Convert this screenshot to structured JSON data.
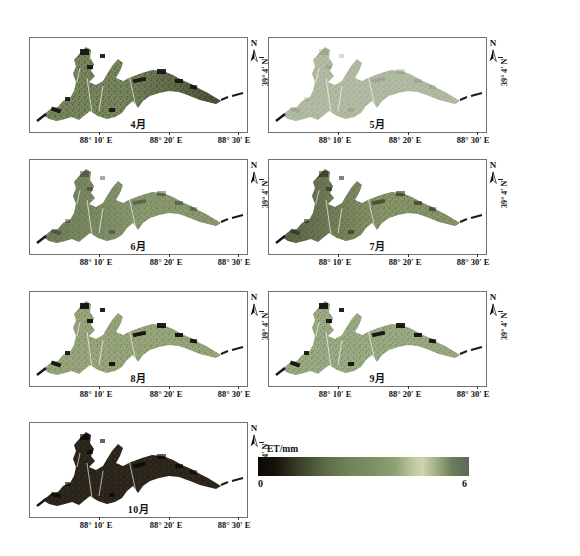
{
  "figure": {
    "north_label": "N",
    "lat_label": "39° 4′ N",
    "x_ticks": [
      "88° 10′ E",
      "88° 20′ E",
      "88° 30′ E"
    ],
    "colorbar": {
      "label": "ET/mm",
      "min": "0",
      "max": "6",
      "gradient": [
        {
          "color": "#0c0a07",
          "pos": 0
        },
        {
          "color": "#181209",
          "pos": 8
        },
        {
          "color": "#3a4229",
          "pos": 20
        },
        {
          "color": "#5d6c44",
          "pos": 32
        },
        {
          "color": "#75855b",
          "pos": 45
        },
        {
          "color": "#7f9064",
          "pos": 55
        },
        {
          "color": "#8fa073",
          "pos": 65
        },
        {
          "color": "#c0caa0",
          "pos": 74
        },
        {
          "color": "#cdd4ae",
          "pos": 78
        },
        {
          "color": "#a3b285",
          "pos": 84
        },
        {
          "color": "#6d7d5c",
          "pos": 92
        },
        {
          "color": "#5d685a",
          "pos": 100
        }
      ]
    }
  },
  "panels": [
    {
      "month_label": "4月",
      "base_color": "#78875d",
      "speckle_color": "#2a2a1c",
      "speckle_opacity": 0.5,
      "shade_side": "right",
      "shade_color": "#141208",
      "shade_opacity": 0.45,
      "patch_color": "#131110",
      "patch_opacity": 0.9
    },
    {
      "month_label": "5月",
      "base_color": "#b2bba3",
      "speckle_color": "#879279",
      "speckle_opacity": 0.45,
      "shade_side": "none",
      "shade_color": "#000000",
      "shade_opacity": 0,
      "patch_color": "#6f7a60",
      "patch_opacity": 0.25
    },
    {
      "month_label": "6月",
      "base_color": "#8a9970",
      "speckle_color": "#4e5c40",
      "speckle_opacity": 0.45,
      "shade_side": "left",
      "shade_color": "#2c3520",
      "shade_opacity": 0.3,
      "patch_color": "#24291a",
      "patch_opacity": 0.4
    },
    {
      "month_label": "7月",
      "base_color": "#879569",
      "speckle_color": "#47543a",
      "speckle_opacity": 0.5,
      "shade_side": "left",
      "shade_color": "#222a18",
      "shade_opacity": 0.45,
      "patch_color": "#1c2113",
      "patch_opacity": 0.55
    },
    {
      "month_label": "8月",
      "base_color": "#98a67c",
      "speckle_color": "#3c4431",
      "speckle_opacity": 0.35,
      "shade_side": "none",
      "shade_color": "#000000",
      "shade_opacity": 0,
      "patch_color": "#0a0a08",
      "patch_opacity": 0.9
    },
    {
      "month_label": "9月",
      "base_color": "#9bab83",
      "speckle_color": "#3c4431",
      "speckle_opacity": 0.35,
      "shade_side": "none",
      "shade_color": "#000000",
      "shade_opacity": 0,
      "patch_color": "#0a0a08",
      "patch_opacity": 0.9
    },
    {
      "month_label": "10月",
      "base_color": "#282219",
      "speckle_color": "#6e6247",
      "speckle_opacity": 0.3,
      "shade_side": "none",
      "shade_color": "#000000",
      "shade_opacity": 0,
      "patch_color": "#000000",
      "patch_opacity": 0.6
    }
  ]
}
